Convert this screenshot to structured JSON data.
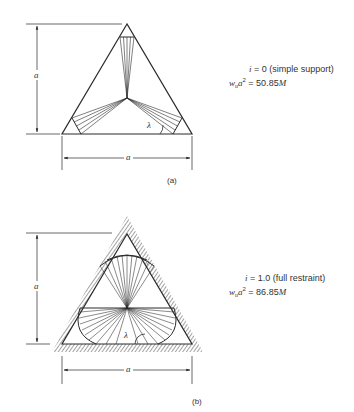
{
  "figure_a": {
    "caption": "(a)",
    "dimension_vertical_label": "a",
    "dimension_horizontal_label": "a",
    "angle_label": "λ",
    "eq_line1_var": "i",
    "eq_line1_rest": " = 0 (simple support)",
    "eq_line2_w": "w",
    "eq_line2_sub": "u",
    "eq_line2_a": "a",
    "eq_line2_sup": "2",
    "eq_line2_rest": " = 50.85",
    "eq_line2_M": "M"
  },
  "figure_b": {
    "caption": "(b)",
    "dimension_vertical_label": "a",
    "dimension_horizontal_label": "a",
    "angle_label": "λ",
    "eq_line1_var": "i",
    "eq_line1_rest": " = 1.0 (full restraint)",
    "eq_line2_w": "w",
    "eq_line2_sub": "u",
    "eq_line2_a": "a",
    "eq_line2_sup": "2",
    "eq_line2_rest": " = 86.85",
    "eq_line2_M": "M"
  },
  "colors": {
    "line": "#2a2a2a",
    "hatch": "#555555"
  }
}
